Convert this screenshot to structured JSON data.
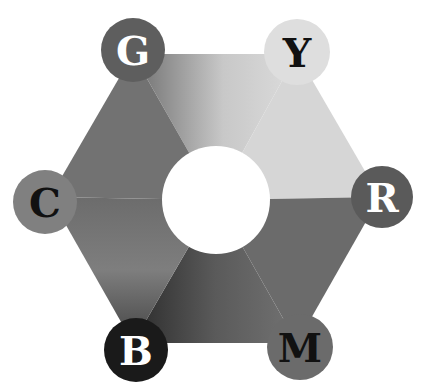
{
  "diagram": {
    "title": "",
    "type": "color-hexagon",
    "center_hole": {
      "cx": 216,
      "cy": 200,
      "r": 54,
      "color": "#ffffff"
    },
    "hexagon": {
      "vertices": [
        [
          133,
          54
        ],
        [
          297,
          54
        ],
        [
          380,
          197
        ],
        [
          297,
          343
        ],
        [
          133,
          343
        ],
        [
          50,
          197
        ]
      ],
      "sector_colors": {
        "G": "#6f6f6f",
        "Y": "#d8d8d8",
        "R": "#6a6a6a",
        "M": "#717171",
        "B": "#2a2a2a",
        "C": "#7d7d7d"
      }
    },
    "nodes": [
      {
        "id": "G",
        "label": "G",
        "cx": 133,
        "cy": 50,
        "r": 32,
        "fill": "#5e5e5e",
        "text_color": "#ffffff"
      },
      {
        "id": "Y",
        "label": "Y",
        "cx": 297,
        "cy": 52,
        "r": 33,
        "fill": "#dedede",
        "text_color": "#111111"
      },
      {
        "id": "R",
        "label": "R",
        "cx": 382,
        "cy": 197,
        "r": 31,
        "fill": "#5a5a5a",
        "text_color": "#ffffff"
      },
      {
        "id": "M",
        "label": "M",
        "cx": 300,
        "cy": 347,
        "r": 33,
        "fill": "#6b6b6b",
        "text_color": "#111111"
      },
      {
        "id": "B",
        "label": "B",
        "cx": 136,
        "cy": 350,
        "r": 32,
        "fill": "#1a1a1a",
        "text_color": "#ffffff"
      },
      {
        "id": "C",
        "label": "C",
        "cx": 45,
        "cy": 202,
        "r": 32,
        "fill": "#808080",
        "text_color": "#111111"
      }
    ]
  }
}
